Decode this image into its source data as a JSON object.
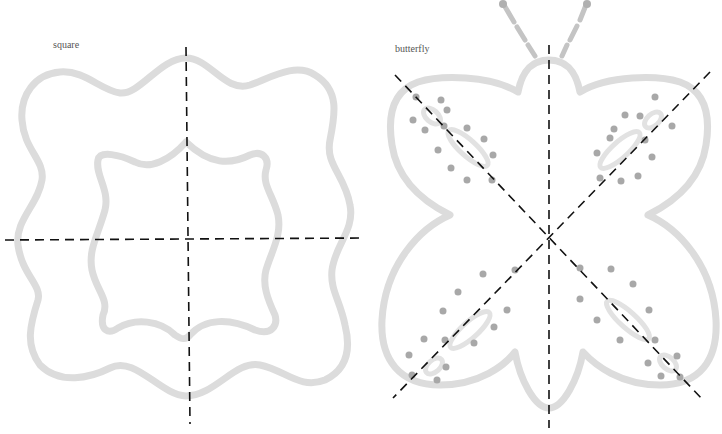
{
  "figures": [
    {
      "label": "square",
      "type": "wavy-square-outline",
      "symmetry_lines": [
        "vertical",
        "horizontal"
      ],
      "symmetry_line_count": 2
    },
    {
      "label": "butterfly",
      "type": "butterfly-outline",
      "symmetry_lines": [
        "vertical",
        "diagonal-down",
        "diagonal-up"
      ],
      "symmetry_line_count": 3
    }
  ],
  "colors": {
    "outline": "#dcdcdc",
    "outline_dark": "#c8c8c8",
    "dots": "#a8a8a8",
    "dashed_line": "#111111",
    "background": "#ffffff"
  }
}
